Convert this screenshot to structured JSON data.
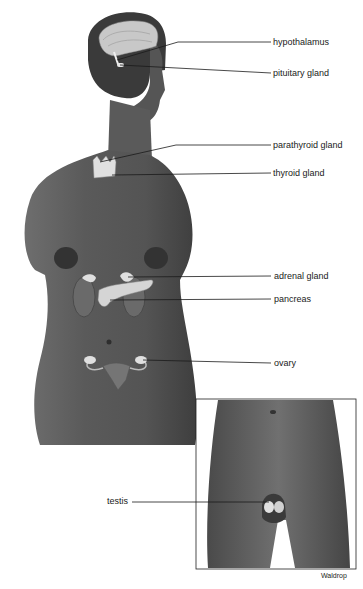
{
  "diagram": {
    "colors": {
      "skin_dark": "#3c3c3c",
      "skin_mid": "#5a5a5a",
      "skin_light": "#7a7a7a",
      "gland_fill": "#d9d9d9",
      "brain_fill": "#c8c8c8",
      "leader_line": "#1a1a1a",
      "background": "#ffffff"
    },
    "labels": [
      {
        "id": "hypothalamus",
        "text": "hypothalamus",
        "x": 273,
        "y": 48
      },
      {
        "id": "pituitary",
        "text": "pituitary gland",
        "x": 273,
        "y": 81
      },
      {
        "id": "parathyroid",
        "text": "parathyroid gland",
        "x": 273,
        "y": 138
      },
      {
        "id": "thyroid",
        "text": "thyroid gland",
        "x": 273,
        "y": 166
      },
      {
        "id": "adrenal",
        "text": "adrenal gland",
        "x": 274,
        "y": 267
      },
      {
        "id": "pancreas",
        "text": "pancreas",
        "x": 274,
        "y": 292
      },
      {
        "id": "ovary",
        "text": "ovary",
        "x": 274,
        "y": 356
      },
      {
        "id": "testis",
        "text": "testis",
        "x": 107,
        "y": 495
      }
    ],
    "inset": {
      "name": "male-pelvis-inset",
      "x": 196,
      "y": 399,
      "width": 160,
      "height": 170
    },
    "credit": "Waldrop"
  }
}
